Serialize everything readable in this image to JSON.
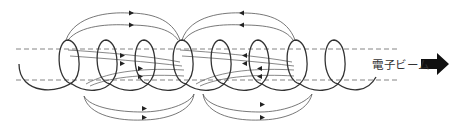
{
  "diagram": {
    "label": "電子ビーム",
    "colors": {
      "helix": "#333333",
      "field_lines": "#555555",
      "dashed_lines": "#666666",
      "arrow": "#111111",
      "text": "#333333"
    },
    "elements": {
      "helix_coil": "helical electron trajectory with 8 loops",
      "beam_boundaries": "two horizontal dashed lines",
      "field_loops_top": "two groups of outer arcs above the beam",
      "field_loops_bottom": "two groups of outer arcs below the beam",
      "beam_direction_arrow": "thick right-pointing arrow"
    },
    "arrow_directions": {
      "top_left_loops": "right",
      "top_right_loops": "left",
      "bottom_left_loops": "right",
      "bottom_right_loops": "right",
      "inner_left_lines": "right",
      "inner_right_lines": "left"
    }
  }
}
